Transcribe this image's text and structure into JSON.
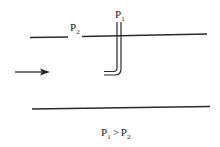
{
  "diagram": {
    "type": "pitot-tube-flow",
    "labels": {
      "p1": {
        "main": "P",
        "sub": "1"
      },
      "p2": {
        "main": "P",
        "sub": "2"
      }
    },
    "relation": {
      "left": {
        "main": "P",
        "sub": "1"
      },
      "operator": ">",
      "right": {
        "main": "P",
        "sub": "2"
      }
    },
    "flow_direction": "right",
    "colors": {
      "stroke": "#2a2a2a",
      "text": "#1a1a1a"
    }
  }
}
